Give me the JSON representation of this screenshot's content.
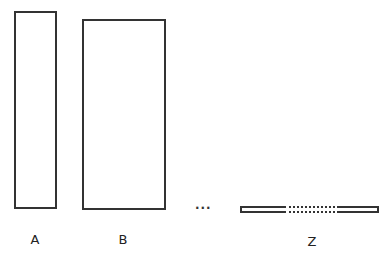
{
  "diagram": {
    "type": "sequence-of-rectangles",
    "items": [
      {
        "id": "A",
        "label": "A",
        "shape": "tall narrow rectangle"
      },
      {
        "id": "B",
        "label": "B",
        "shape": "tall wide rectangle"
      },
      {
        "id": "ellipsis",
        "label": "...",
        "shape": "continuation marker"
      },
      {
        "id": "Z",
        "label": "Z",
        "shape": "very flat long rectangle with dotted middle section"
      }
    ],
    "colors": {
      "stroke": "#333333",
      "background": "#ffffff",
      "text": "#222222"
    }
  }
}
